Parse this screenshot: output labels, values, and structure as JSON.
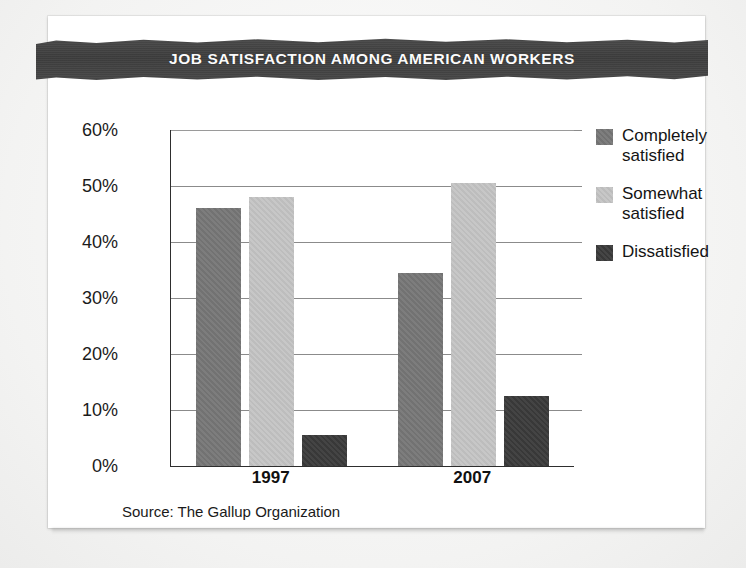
{
  "card": {
    "banner_title": "JOB SATISFACTION AMONG AMERICAN WORKERS",
    "source_note": "Source: The Gallup Organization"
  },
  "colors": {
    "completely_satisfied": "#767676",
    "somewhat_satisfied": "#c4c4c4",
    "dissatisfied": "#3a3a3a",
    "banner_bg": "#414141",
    "banner_text": "#ffffff",
    "axis": "#2e2e2e",
    "gridline": "#8b8b8b",
    "card_bg": "#ffffff",
    "page_bg": "#f2f2f1"
  },
  "legend": {
    "items": [
      {
        "label": "Completely\nsatisfied",
        "color": "#767676"
      },
      {
        "label": "Somewhat\nsatisfied",
        "color": "#c4c4c4"
      },
      {
        "label": "Dissatisfied",
        "color": "#3a3a3a"
      }
    ]
  },
  "axis": {
    "y_ticks": [
      "60%",
      "50%",
      "40%",
      "30%",
      "20%",
      "10%",
      "0%"
    ],
    "x_ticks": [
      "1997",
      "2007"
    ]
  },
  "chart_data": {
    "type": "bar",
    "title": "JOB SATISFACTION AMONG AMERICAN WORKERS",
    "subtitle": "",
    "xlabel": "",
    "ylabel": "",
    "ylim": [
      0,
      60
    ],
    "ytick_values": [
      0,
      10,
      20,
      30,
      40,
      50,
      60
    ],
    "ytick_labels": [
      "0%",
      "10%",
      "20%",
      "30%",
      "40%",
      "50%",
      "60%"
    ],
    "grid": true,
    "legend_position": "right",
    "categories": [
      "1997",
      "2007"
    ],
    "series": [
      {
        "name": "Completely satisfied",
        "color": "#767676",
        "values": [
          46,
          34.5
        ]
      },
      {
        "name": "Somewhat satisfied",
        "color": "#c4c4c4",
        "values": [
          48,
          50.5
        ]
      },
      {
        "name": "Dissatisfied",
        "color": "#3a3a3a",
        "values": [
          5.5,
          12.5
        ]
      }
    ],
    "source": "Source: The Gallup Organization"
  }
}
